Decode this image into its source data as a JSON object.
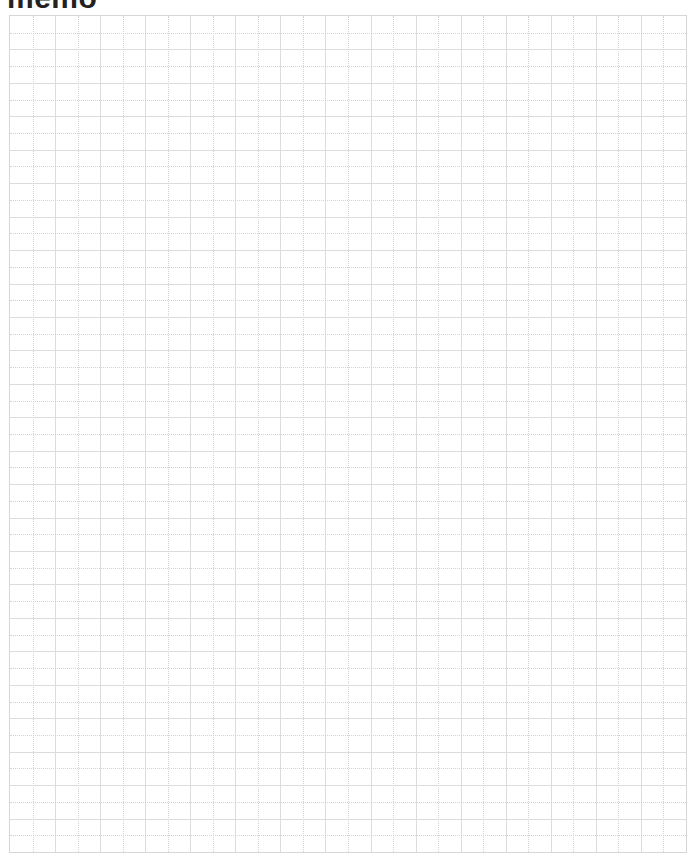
{
  "page": {
    "title": "memo"
  },
  "grid": {
    "columns": 30,
    "rows": 50,
    "line_color": "#d6d6d6",
    "background": "#ffffff"
  }
}
